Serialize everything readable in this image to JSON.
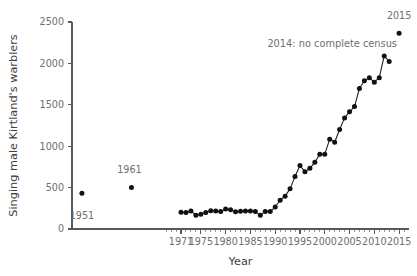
{
  "chart_data": {
    "type": "scatter",
    "title": "",
    "xlabel": "Year",
    "ylabel": "Singing male Kirtland's warblers",
    "xlim": [
      1949,
      2017
    ],
    "ylim": [
      0,
      2500
    ],
    "grid": false,
    "legend": null,
    "y_ticks": [
      0,
      500,
      1000,
      1500,
      2000,
      2500
    ],
    "y_tick_labels": [
      "0",
      "500",
      "1000",
      "1500",
      "2000",
      "2500"
    ],
    "x_ticks": [
      1971,
      1975,
      1980,
      1985,
      1990,
      1995,
      2000,
      2005,
      2010,
      2015
    ],
    "x_tick_labels": [
      "1971",
      "1975",
      "1980",
      "1985",
      "1990",
      "1995",
      "2000",
      "2005",
      "2010",
      "2015"
    ],
    "x_minor_tick_step": 1,
    "x_minor_tick_range": [
      1968,
      2016
    ],
    "series": [
      {
        "name": "early-surveys",
        "connected": false,
        "x": [
          1951,
          1961
        ],
        "values": [
          432,
          502
        ]
      },
      {
        "name": "annual-census",
        "connected": true,
        "x": [
          1971,
          1972,
          1973,
          1974,
          1975,
          1976,
          1977,
          1978,
          1979,
          1980,
          1981,
          1982,
          1983,
          1984,
          1985,
          1986,
          1987,
          1988,
          1989,
          1990,
          1991,
          1992,
          1993,
          1994,
          1995,
          1996,
          1997,
          1998,
          1999,
          2000,
          2001,
          2002,
          2003,
          2004,
          2005,
          2006,
          2007,
          2008,
          2009,
          2010,
          2011,
          2012,
          2013
        ],
        "values": [
          201,
          200,
          216,
          167,
          179,
          200,
          219,
          218,
          210,
          242,
          232,
          207,
          215,
          216,
          217,
          210,
          167,
          212,
          212,
          265,
          347,
          397,
          485,
          633,
          766,
          692,
          733,
          805,
          903,
          902,
          1085,
          1047,
          1202,
          1342,
          1415,
          1478,
          1697,
          1791,
          1826,
          1773,
          1828,
          2090,
          2023
        ]
      },
      {
        "name": "final-census",
        "connected": false,
        "x": [
          2015
        ],
        "values": [
          2365
        ]
      }
    ],
    "annotations": [
      {
        "name": "label-1951",
        "text": "1951",
        "x": 1951,
        "y": 432,
        "dx": 0,
        "dy": 26
      },
      {
        "name": "label-1961",
        "text": "1961",
        "x": 1961,
        "y": 502,
        "dx": -2,
        "dy": -14
      },
      {
        "name": "label-2015",
        "text": "2015",
        "x": 2015,
        "y": 2365,
        "dx": 0,
        "dy": -14
      },
      {
        "name": "note-2014-no-census",
        "text": "2014: no complete census",
        "x": 2001.5,
        "y": 2200,
        "dx": 0,
        "dy": 0
      }
    ]
  },
  "colors": {
    "marker": "#111111",
    "line": "#1a1a1a",
    "axis": "#58595b",
    "tick_text": "#6d6e71",
    "axis_title": "#3f4042",
    "background": "#ffffff"
  }
}
